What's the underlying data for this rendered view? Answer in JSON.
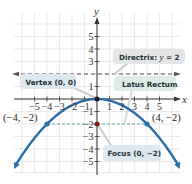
{
  "chart_data": {
    "type": "line",
    "title": "",
    "equation": "x^2 = -8y",
    "xlabel": "x",
    "ylabel": "y",
    "xlim": [
      -6.5,
      6.5
    ],
    "ylim": [
      -5.8,
      6.5
    ],
    "grid": true,
    "x_ticks": [
      -5,
      -4,
      -3,
      -2,
      -1,
      1,
      2,
      3,
      4,
      5
    ],
    "x_tick_labels": [
      "−5",
      "−4",
      "−3",
      "−2",
      "−1",
      "1",
      "2",
      "3",
      "4",
      "5"
    ],
    "y_ticks": [
      5,
      4,
      3,
      1,
      -1,
      -2,
      -3,
      -4,
      -5
    ],
    "y_tick_labels": [
      "5",
      "4",
      "3",
      "1",
      "−1",
      "−2",
      "−3",
      "−4",
      "−5"
    ],
    "series": [
      {
        "name": "Parabola",
        "color": "#2e6da4",
        "x": [
          -6.5,
          -6,
          -5,
          -4,
          -3,
          -2,
          -1,
          0,
          1,
          2,
          3,
          4,
          5,
          6,
          6.5
        ],
        "values": [
          -5.28,
          -4.5,
          -3.125,
          -2,
          -1.125,
          -0.5,
          -0.125,
          0,
          -0.125,
          -0.5,
          -1.125,
          -2,
          -3.125,
          -4.5,
          -5.28
        ]
      }
    ],
    "points": [
      {
        "name": "vertex",
        "x": 0,
        "y": 0,
        "color": "#1a1a1a"
      },
      {
        "name": "focus",
        "x": 0,
        "y": -2,
        "color": "#7a1f1f"
      },
      {
        "name": "latus-left",
        "x": -4,
        "y": -2,
        "color": "#2e6da4",
        "label": "(−4, −2)"
      },
      {
        "name": "latus-right",
        "x": 4,
        "y": -2,
        "color": "#2e6da4",
        "label": "(4, −2)"
      }
    ],
    "lines": [
      {
        "name": "directrix",
        "y": 2,
        "style": "dashed",
        "color": "#555555"
      },
      {
        "name": "latus-rectum",
        "y": -2,
        "x_from": -4,
        "x_to": 4,
        "style": "dashed",
        "color": "#6aa8a0"
      }
    ],
    "annotations": [
      {
        "name": "directrix",
        "text_prefix": "Directrix: ",
        "var": "y",
        "text_suffix": " = 2",
        "bg": "#e4e5e6"
      },
      {
        "name": "vertex",
        "text": "Vertex (0, 0)",
        "bg": "#dde8ef"
      },
      {
        "name": "latus-rectum",
        "text": "Latus Rectum",
        "bg": "#dcebe4"
      },
      {
        "name": "focus",
        "text": "Focus (0, −2)",
        "bg": "#dde8ef"
      }
    ]
  }
}
